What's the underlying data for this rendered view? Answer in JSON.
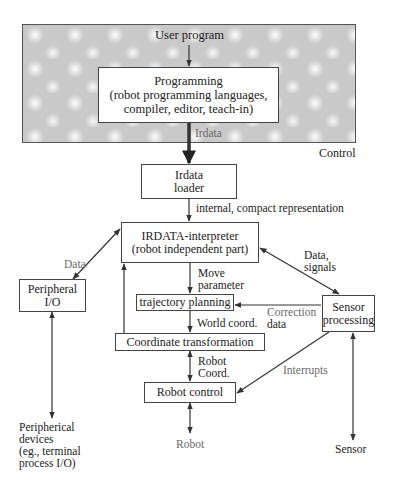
{
  "diagram": {
    "control_region": {
      "label": "Control"
    },
    "nodes": {
      "user_program": {
        "label": "User program"
      },
      "programming": {
        "line1": "Programming",
        "line2": "(robot programming languages,",
        "line3": "compiler, editor, teach-in)"
      },
      "irdata_loader": {
        "line1": "Irdata",
        "line2": "loader"
      },
      "interpreter": {
        "line1": "IRDATA-interpreter",
        "line2": "(robot independent part)"
      },
      "peripheral_io": {
        "line1": "Peripheral",
        "line2": "I/O"
      },
      "trajectory_planning": {
        "label": "trajectory planning"
      },
      "coordinate_transformation": {
        "label": "Coordinate transformation"
      },
      "sensor_processing": {
        "line1": "Sensor",
        "line2": "processing"
      },
      "robot_control": {
        "label": "Robot control"
      },
      "peripheral_devices": {
        "line1": "Peripherical",
        "line2": "devices",
        "line3": "(eg., terminal",
        "line4": "process I/O)"
      },
      "robot": {
        "label": "Robot"
      },
      "sensor": {
        "label": "Sensor"
      }
    },
    "edge_labels": {
      "irdata": "Irdata",
      "internal_compact": "internal, compact representation",
      "data": "Data",
      "data_signals_1": "Data,",
      "data_signals_2": "signals",
      "move_parameter_1": "Move",
      "move_parameter_2": "parameter",
      "correction_1": "Correction",
      "correction_2": "data",
      "world_coord": "World coord.",
      "robot_coord_1": "Robot",
      "robot_coord_2": "Coord.",
      "interrupts": "Interrupts"
    },
    "edges": [
      {
        "from": "user_program",
        "to": "programming",
        "label": ""
      },
      {
        "from": "programming",
        "to": "irdata_loader",
        "label": "Irdata"
      },
      {
        "from": "irdata_loader",
        "to": "interpreter",
        "label": "internal, compact representation"
      },
      {
        "from": "interpreter",
        "to": "peripheral_io",
        "label": "Data",
        "bidirectional": true
      },
      {
        "from": "interpreter",
        "to": "sensor_processing",
        "label": "Data, signals",
        "bidirectional": true
      },
      {
        "from": "interpreter",
        "to": "trajectory_planning",
        "label": "Move parameter"
      },
      {
        "from": "sensor_processing",
        "to": "trajectory_planning",
        "label": "Correction data"
      },
      {
        "from": "trajectory_planning",
        "to": "coordinate_transformation",
        "label": "World coord."
      },
      {
        "from": "coordinate_transformation",
        "to": "interpreter",
        "label": ""
      },
      {
        "from": "coordinate_transformation",
        "to": "robot_control",
        "label": "Robot Coord.",
        "bidirectional": true
      },
      {
        "from": "sensor_processing",
        "to": "robot_control",
        "label": "Interrupts"
      },
      {
        "from": "robot_control",
        "to": "robot",
        "label": "",
        "bidirectional": true
      },
      {
        "from": "peripheral_io",
        "to": "peripheral_devices",
        "label": "",
        "bidirectional": true
      },
      {
        "from": "sensor_processing",
        "to": "sensor",
        "label": "",
        "bidirectional": true
      }
    ]
  }
}
